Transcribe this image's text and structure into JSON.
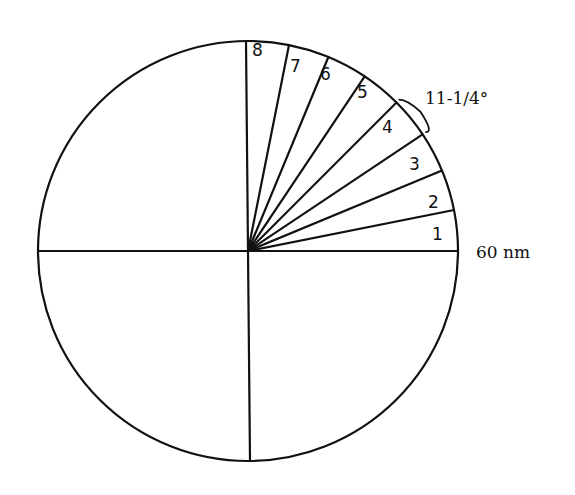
{
  "diagram": {
    "center": [
      248,
      251
    ],
    "radius": 210,
    "circle_color": "#111111",
    "sector_angle_label": "11-1/4°",
    "range_label": "60 nm",
    "sectors": [
      {
        "number": "1",
        "label_pos": [
          432,
          240
        ]
      },
      {
        "number": "2",
        "label_pos": [
          428,
          208
        ]
      },
      {
        "number": "3",
        "label_pos": [
          409,
          170
        ]
      },
      {
        "number": "4",
        "label_pos": [
          382,
          133
        ]
      },
      {
        "number": "5",
        "label_pos": [
          357,
          98
        ]
      },
      {
        "number": "6",
        "label_pos": [
          320,
          80
        ]
      },
      {
        "number": "7",
        "label_pos": [
          290,
          72
        ]
      },
      {
        "number": "8",
        "label_pos": [
          252,
          56
        ]
      }
    ],
    "sector_step_degrees": 11.25,
    "sector_count": 8
  }
}
